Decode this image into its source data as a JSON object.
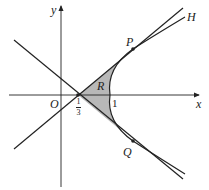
{
  "diagram": {
    "labels": {
      "x_axis": "x",
      "y_axis": "y",
      "origin": "O",
      "region": "R",
      "point_p": "P",
      "point_q": "Q",
      "curve": "H",
      "tick_one": "1",
      "tick_third_num": "1",
      "tick_third_den": "3"
    },
    "colors": {
      "stroke": "#222222",
      "shade": "#b8b8b8"
    }
  }
}
